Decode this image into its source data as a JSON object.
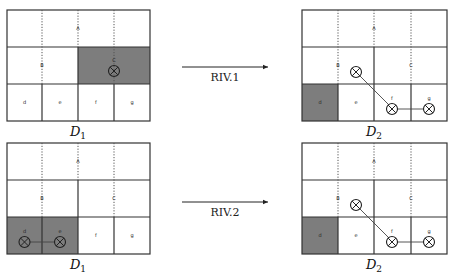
{
  "panels": [
    {
      "id": "top-left",
      "label_base": "D",
      "label_sub": "1",
      "cells": {
        "top": "A",
        "mid_left": "B",
        "mid_right": "C",
        "bottom": [
          "d",
          "e",
          "f",
          "g"
        ]
      },
      "shaded": [
        "C"
      ],
      "markers": [
        "C"
      ]
    },
    {
      "id": "top-right",
      "label_base": "D",
      "label_sub": "2",
      "cells": {
        "top": "A",
        "mid_left": "B",
        "mid_right": "C",
        "bottom": [
          "d",
          "e",
          "f",
          "g"
        ]
      },
      "shaded": [
        "d"
      ],
      "markers": [
        "B-region",
        "f",
        "g"
      ]
    },
    {
      "id": "bottom-left",
      "label_base": "D",
      "label_sub": "1",
      "cells": {
        "top": "A",
        "mid_left": "B",
        "mid_right": "C",
        "bottom": [
          "d",
          "e",
          "f",
          "g"
        ]
      },
      "shaded": [
        "d",
        "e"
      ],
      "markers": [
        "d",
        "e"
      ]
    },
    {
      "id": "bottom-right",
      "label_base": "D",
      "label_sub": "2",
      "cells": {
        "top": "A",
        "mid_left": "B",
        "mid_right": "C",
        "bottom": [
          "d",
          "e",
          "f",
          "g"
        ]
      },
      "shaded": [
        "d"
      ],
      "markers": [
        "B-region",
        "f",
        "g"
      ]
    }
  ],
  "arrows": [
    {
      "label": "RIV.1"
    },
    {
      "label": "RIV.2"
    }
  ],
  "colors": {
    "shade": "#7d7d7d",
    "line": "#333333"
  }
}
